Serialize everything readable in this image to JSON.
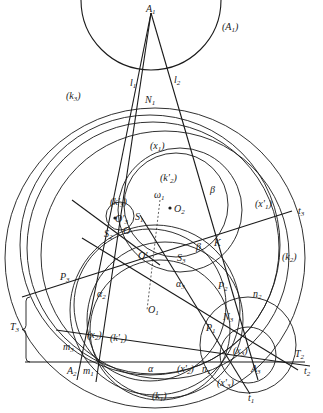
{
  "figure": {
    "width": 323,
    "height": 413,
    "stroke_color": "#1a1a1a",
    "background": "#ffffff"
  },
  "circles": [
    {
      "id": "A1-circle",
      "cx": 151,
      "cy": 0,
      "r": 70,
      "label": "(A1)"
    },
    {
      "id": "k3",
      "cx": 150,
      "cy": 245,
      "r": 130,
      "label": "(k3)"
    },
    {
      "id": "k3-inner",
      "cx": 153,
      "cy": 248,
      "r": 126,
      "label": ""
    },
    {
      "id": "x1-prime",
      "cx": 165,
      "cy": 255,
      "r": 124,
      "label": "(x'1)"
    },
    {
      "id": "k2",
      "cx": 155,
      "cy": 258,
      "r": 150,
      "label": "(k2)"
    },
    {
      "id": "x1",
      "cx": 180,
      "cy": 210,
      "r": 62,
      "label": "(x1)"
    },
    {
      "id": "k2-prime",
      "cx": 176,
      "cy": 205,
      "r": 52,
      "label": "(k'2)"
    },
    {
      "id": "k3-prime",
      "cx": 120,
      "cy": 216,
      "r": 14,
      "label": "(k'3)"
    },
    {
      "id": "k1",
      "cx": 155,
      "cy": 310,
      "r": 85,
      "label": "(k1)"
    },
    {
      "id": "k1-prime",
      "cx": 165,
      "cy": 320,
      "r": 78,
      "label": "(k'1)"
    },
    {
      "id": "x2",
      "cx": 150,
      "cy": 305,
      "r": 76,
      "label": "(x2)"
    },
    {
      "id": "x2-prime",
      "cx": 160,
      "cy": 330,
      "r": 70,
      "label": "(x'2)"
    },
    {
      "id": "x3",
      "cx": 248,
      "cy": 355,
      "r": 28,
      "label": "(x3)"
    },
    {
      "id": "x3-prime",
      "cx": 248,
      "cy": 345,
      "r": 48,
      "label": "(x'3)"
    }
  ],
  "lines": [
    {
      "id": "A1-A2",
      "x1": 151,
      "y1": 13,
      "x2": 77,
      "y2": 380
    },
    {
      "id": "A1-m1",
      "x1": 151,
      "y1": 13,
      "x2": 96,
      "y2": 382
    },
    {
      "id": "A1-A3",
      "x1": 151,
      "y1": 13,
      "x2": 258,
      "y2": 380
    },
    {
      "id": "base",
      "x1": 25,
      "y1": 362,
      "x2": 305,
      "y2": 362
    },
    {
      "id": "t3",
      "x1": 22,
      "y1": 297,
      "x2": 292,
      "y2": 211
    },
    {
      "id": "t2",
      "x1": 82,
      "y1": 238,
      "x2": 298,
      "y2": 370
    },
    {
      "id": "t1",
      "x1": 140,
      "y1": 215,
      "x2": 250,
      "y2": 394
    },
    {
      "id": "m3-line",
      "x1": 56,
      "y1": 330,
      "x2": 310,
      "y2": 366
    },
    {
      "id": "t-left",
      "x1": 72,
      "y1": 200,
      "x2": 160,
      "y2": 265
    }
  ],
  "dashed_lines": [
    {
      "id": "omega1-axis",
      "x1": 160,
      "y1": 200,
      "x2": 147,
      "y2": 310
    }
  ],
  "points": [
    {
      "id": "O2",
      "x": 170,
      "y": 208
    },
    {
      "id": "O'3",
      "x": 115,
      "y": 218
    }
  ],
  "bracket": {
    "label": "T3",
    "x": 26,
    "top": 297,
    "bottom": 362
  },
  "labels": [
    {
      "id": "A1",
      "text": "A",
      "sub": "1",
      "x": 146,
      "y": 12
    },
    {
      "id": "A1-circle-label",
      "text": "(A",
      "sub": "1",
      "tail": ")",
      "x": 222,
      "y": 30
    },
    {
      "id": "l1",
      "text": "l",
      "sub": "1",
      "x": 130,
      "y": 86
    },
    {
      "id": "l2",
      "text": "l",
      "sub": "2",
      "x": 174,
      "y": 83
    },
    {
      "id": "N1",
      "text": "N",
      "sub": "1",
      "x": 145,
      "y": 103
    },
    {
      "id": "k3-label",
      "text": "(k",
      "sub": "3",
      "tail": ")",
      "x": 66,
      "y": 99
    },
    {
      "id": "x1-label",
      "text": "(x",
      "sub": "1",
      "tail": ")",
      "x": 150,
      "y": 149
    },
    {
      "id": "k2p-label",
      "text": "(k'",
      "sub": "2",
      "tail": ")",
      "x": 160,
      "y": 181
    },
    {
      "id": "beta-top",
      "text": "β",
      "sub": "",
      "x": 210,
      "y": 193
    },
    {
      "id": "omega1",
      "text": "ω",
      "sub": "1",
      "x": 154,
      "y": 198
    },
    {
      "id": "O2-label",
      "text": "O",
      "sub": "2",
      "x": 174,
      "y": 212
    },
    {
      "id": "k3p-label",
      "text": "(k'",
      "sub": "3",
      "tail": ")",
      "x": 110,
      "y": 205
    },
    {
      "id": "O3p-label",
      "text": "O'",
      "sub": "3",
      "x": 115,
      "y": 222
    },
    {
      "id": "S1",
      "text": "S",
      "sub": "1",
      "x": 135,
      "y": 220
    },
    {
      "id": "S2",
      "text": "S",
      "sub": "2",
      "x": 104,
      "y": 237
    },
    {
      "id": "O",
      "text": "O",
      "sub": "",
      "x": 123,
      "y": 234
    },
    {
      "id": "x1p-label",
      "text": "(x'",
      "sub": "1",
      "tail": ")",
      "x": 255,
      "y": 207
    },
    {
      "id": "t3-label",
      "text": "t",
      "sub": "3",
      "x": 298,
      "y": 214
    },
    {
      "id": "beta-mid",
      "text": "β",
      "sub": "",
      "x": 196,
      "y": 250
    },
    {
      "id": "K",
      "text": "K",
      "sub": "",
      "x": 214,
      "y": 246
    },
    {
      "id": "O-prime",
      "text": "O'",
      "sub": "",
      "x": 138,
      "y": 259
    },
    {
      "id": "S3",
      "text": "S",
      "sub": "3",
      "x": 177,
      "y": 261
    },
    {
      "id": "k2-label",
      "text": "(k",
      "sub": "2",
      "tail": ")",
      "x": 282,
      "y": 260
    },
    {
      "id": "P3",
      "text": "P",
      "sub": "3",
      "x": 60,
      "y": 280
    },
    {
      "id": "alpha3",
      "text": "α",
      "sub": "3",
      "x": 176,
      "y": 287
    },
    {
      "id": "P2",
      "text": "P",
      "sub": "2",
      "x": 218,
      "y": 289
    },
    {
      "id": "alpha2",
      "text": "α",
      "sub": "2",
      "x": 97,
      "y": 297
    },
    {
      "id": "n2",
      "text": "n",
      "sub": "2",
      "x": 253,
      "y": 297
    },
    {
      "id": "N3",
      "text": "N",
      "sub": "3",
      "x": 223,
      "y": 320
    },
    {
      "id": "O1",
      "text": "O",
      "sub": "1",
      "x": 148,
      "y": 313
    },
    {
      "id": "P1",
      "text": "P",
      "sub": "1",
      "x": 206,
      "y": 331
    },
    {
      "id": "T3-label",
      "text": "T",
      "sub": "3",
      "x": 10,
      "y": 330
    },
    {
      "id": "x2-label",
      "text": "(x",
      "sub": "2",
      "tail": ")",
      "x": 87,
      "y": 338
    },
    {
      "id": "k1p-label",
      "text": "(k'",
      "sub": "1",
      "tail": ")",
      "x": 110,
      "y": 341
    },
    {
      "id": "x3-label",
      "text": "(x",
      "sub": "3",
      "tail": ")",
      "x": 233,
      "y": 354
    },
    {
      "id": "m3",
      "text": "m",
      "sub": "3",
      "x": 63,
      "y": 350
    },
    {
      "id": "A2",
      "text": "A",
      "sub": "2",
      "x": 67,
      "y": 374
    },
    {
      "id": "m1",
      "text": "m",
      "sub": "1",
      "x": 83,
      "y": 374
    },
    {
      "id": "alpha-base",
      "text": "α",
      "sub": "",
      "x": 148,
      "y": 372
    },
    {
      "id": "x2p-label",
      "text": "(x'",
      "sub": "2",
      "tail": ")",
      "x": 177,
      "y": 372
    },
    {
      "id": "n1",
      "text": "n",
      "sub": "1",
      "x": 202,
      "y": 372
    },
    {
      "id": "A3",
      "text": "A",
      "sub": "3",
      "x": 251,
      "y": 372
    },
    {
      "id": "T2",
      "text": "T",
      "sub": "2",
      "x": 295,
      "y": 357
    },
    {
      "id": "t2-label",
      "text": "t",
      "sub": "2",
      "x": 304,
      "y": 374
    },
    {
      "id": "x3p-label",
      "text": "(x'",
      "sub": "3",
      "tail": ")",
      "x": 217,
      "y": 386
    },
    {
      "id": "k1-label",
      "text": "(k",
      "sub": "1",
      "tail": ")",
      "x": 152,
      "y": 399
    },
    {
      "id": "t1-label",
      "text": "t",
      "sub": "1",
      "x": 248,
      "y": 401
    }
  ]
}
